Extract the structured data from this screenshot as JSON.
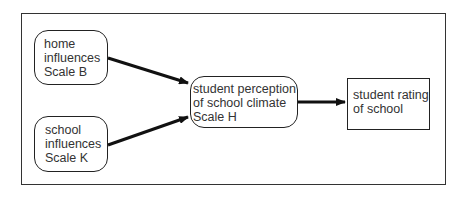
{
  "diagram": {
    "type": "flow",
    "nodes": [
      {
        "id": "home",
        "shape": "rounded-rect",
        "lines": [
          "home",
          "influences",
          "Scale B"
        ]
      },
      {
        "id": "school",
        "shape": "rounded-rect",
        "lines": [
          "school",
          "influences",
          "Scale K"
        ]
      },
      {
        "id": "perception",
        "shape": "rounded-rect",
        "lines": [
          "student perception",
          "of school climate",
          "Scale H"
        ]
      },
      {
        "id": "rating",
        "shape": "rect",
        "lines": [
          "student rating",
          "of school"
        ]
      }
    ],
    "edges": [
      {
        "from": "home",
        "to": "perception"
      },
      {
        "from": "school",
        "to": "perception"
      },
      {
        "from": "perception",
        "to": "rating"
      }
    ],
    "colors": {
      "stroke": "#222222",
      "text": "#333333",
      "background": "#ffffff"
    }
  }
}
